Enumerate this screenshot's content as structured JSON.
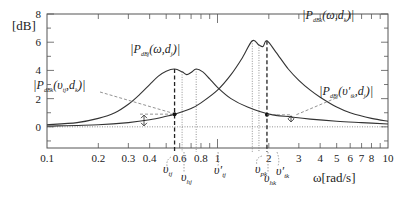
{
  "chart_data": {
    "type": "line",
    "title": "",
    "xlabel": "ω[rad/s]",
    "ylabel": "[dB]",
    "xscale": "log",
    "xlim": [
      0.1,
      10
    ],
    "ylim": [
      -1.5,
      8
    ],
    "grid": false,
    "x_ticks": [
      {
        "value": 0.1,
        "label": "0.1"
      },
      {
        "value": 0.2,
        "label": "0.2"
      },
      {
        "value": 0.3,
        "label": "0.3"
      },
      {
        "value": 0.4,
        "label": "0.4"
      },
      {
        "value": 0.6,
        "label": "0.6"
      },
      {
        "value": 0.8,
        "label": "0.8"
      },
      {
        "value": 1,
        "label": "1"
      },
      {
        "value": 2,
        "label": "2"
      },
      {
        "value": 3,
        "label": "3"
      },
      {
        "value": 4,
        "label": "4"
      },
      {
        "value": 5,
        "label": "5"
      },
      {
        "value": 6,
        "label": "6"
      },
      {
        "value": 7,
        "label": "7"
      },
      {
        "value": 8,
        "label": "8"
      },
      {
        "value": 10,
        "label": "10"
      }
    ],
    "y_ticks": [
      {
        "value": 0,
        "label": "0"
      },
      {
        "value": 2,
        "label": "2"
      },
      {
        "value": 4,
        "label": "4"
      },
      {
        "value": 6,
        "label": "6"
      },
      {
        "value": 8,
        "label": "8"
      }
    ],
    "series": [
      {
        "name": "|P_dBj(ω,d_j)|",
        "style": "solid",
        "x": [
          0.1,
          0.15,
          0.2,
          0.25,
          0.3,
          0.35,
          0.4,
          0.45,
          0.5,
          0.56,
          0.62,
          0.66,
          0.7,
          0.75,
          0.82,
          0.9,
          1.0,
          1.2,
          1.5,
          2.0,
          2.7,
          3.5,
          5.0,
          7.0,
          10.0
        ],
        "y": [
          0.15,
          0.3,
          0.6,
          1.0,
          1.6,
          2.3,
          3.0,
          3.6,
          3.95,
          4.1,
          3.9,
          3.7,
          3.85,
          4.1,
          3.9,
          3.4,
          2.8,
          2.0,
          1.4,
          0.9,
          0.7,
          0.55,
          0.4,
          0.3,
          0.2
        ]
      },
      {
        "name": "|P_dBk(ω,d_k)|",
        "style": "solid",
        "x": [
          0.1,
          0.2,
          0.3,
          0.4,
          0.5,
          0.56,
          0.7,
          0.8,
          1.0,
          1.2,
          1.4,
          1.6,
          1.75,
          1.85,
          1.95,
          2.2,
          2.6,
          3.0,
          3.5,
          4.0,
          5.0,
          6.0,
          8.0,
          10.0
        ],
        "y": [
          0.05,
          0.15,
          0.3,
          0.5,
          0.75,
          0.9,
          1.3,
          1.7,
          2.6,
          3.7,
          4.9,
          6.1,
          5.8,
          5.7,
          6.1,
          5.3,
          4.1,
          3.3,
          2.6,
          2.1,
          1.4,
          1.0,
          0.6,
          0.4
        ]
      }
    ],
    "annotations": [
      {
        "text": "|P_dBj(ω,d_j)|",
        "main": "P",
        "sub": "dBj",
        "args": "(ω,d",
        "argsub": "j",
        "near": "left-peak"
      },
      {
        "text": "|P_dBk(ω,d_k)|",
        "main": "P",
        "sub": "dBk",
        "args": "(ω,d",
        "argsub": "k",
        "near": "right-peak"
      },
      {
        "text": "|P_dBk(υ_tj,d_k)|",
        "main": "P",
        "sub": "dBk",
        "args": "(υ",
        "argsub1": "tj",
        "args2": ",d",
        "argsub": "k",
        "near": "left-marker"
      },
      {
        "text": "|P_dBj(υ'_tk,d_j)|",
        "main": "P",
        "sub": "dBj",
        "args": "(υ′",
        "argsub1": "tk",
        "args2": ",d",
        "argsub": "j",
        "near": "right-marker"
      }
    ],
    "markers": [
      {
        "label": "υ_tj",
        "base": "υ",
        "sub": "tj",
        "x": 0.56,
        "line": "dashed"
      },
      {
        "label": "υ_hj",
        "base": "υ",
        "sub": "hj",
        "x": 0.62,
        "line": "dotted"
      },
      {
        "label": "υ'_tj",
        "base": "υ′",
        "sub": "tj",
        "x": 0.75,
        "line": "dotted"
      },
      {
        "label": "υ_pk",
        "base": "υ",
        "sub": "pk",
        "x": 1.6,
        "line": "dotted"
      },
      {
        "label": "υ_hk",
        "base": "υ",
        "sub": "hk",
        "x": 1.75,
        "line": "dotted"
      },
      {
        "label": "υ'_tk",
        "base": "υ′",
        "sub": "tk",
        "x": 1.95,
        "line": "dashed"
      }
    ],
    "points": [
      {
        "x": 0.56,
        "y": 0.9,
        "series": "|P_dBk(ω,d_k)|"
      },
      {
        "x": 1.95,
        "y": 0.85,
        "series": "|P_dBj(ω,d_j)|"
      }
    ],
    "reference_line": {
      "y": 0,
      "style": "dotted"
    },
    "legend": "none"
  }
}
